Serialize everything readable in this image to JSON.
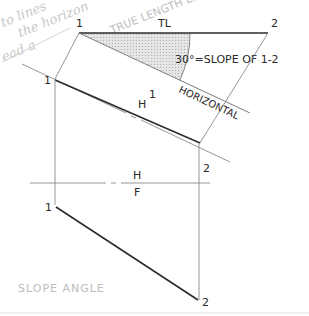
{
  "handwritten_note": {
    "lines": [
      "to line's ⊥",
      "the horizontal",
      "ead a TRUE LENGTH EDGE VIEW"
    ],
    "line1": "to lines",
    "line2": "the horizon",
    "line3": "ead a",
    "line4": "TRUE LENGTH EDGE VIEW"
  },
  "auxiliary_view": {
    "point_1_label": "1",
    "point_2_label": "2",
    "true_length_label": "TL",
    "angle_annotation": "30°=SLOPE OF 1-2",
    "horizontal_label": "HORIZONTAL",
    "shading_color": "#d9d9d9"
  },
  "fold_line_h1": {
    "upper_label": "1",
    "lower_label": "H"
  },
  "top_view": {
    "point_1_label": "1",
    "point_2_label": "2"
  },
  "fold_line_hf": {
    "upper_label": "H",
    "lower_label": "F"
  },
  "front_view": {
    "point_1_label": "1",
    "point_2_label": "2"
  },
  "caption": "SLOPE   ANGLE",
  "colors": {
    "heavy_line": "#2b2b2b",
    "thin_line": "#8a8a8a",
    "handwriting": "#c4c4c4"
  }
}
